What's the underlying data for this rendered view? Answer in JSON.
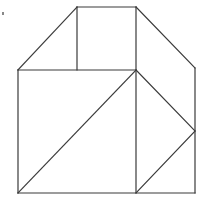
{
  "diagram": {
    "type": "geometric-dissection",
    "stroke_color": "#3a3a3a",
    "background": "#ffffff",
    "vertices": {
      "A": [
        77,
        7
      ],
      "B": [
        136,
        7
      ],
      "C": [
        195,
        68
      ],
      "D": [
        195,
        131
      ],
      "E": [
        195,
        193
      ],
      "F": [
        136,
        193
      ],
      "G": [
        18,
        193
      ],
      "H": [
        18,
        70
      ],
      "I": [
        77,
        70
      ],
      "J": [
        136,
        70
      ]
    },
    "edges": [
      {
        "name": "top-edge",
        "from": "A",
        "to": "B"
      },
      {
        "name": "roof-right",
        "from": "B",
        "to": "C"
      },
      {
        "name": "right-edge",
        "from": "C",
        "to": "E"
      },
      {
        "name": "bottom-edge",
        "from": "E",
        "to": "G"
      },
      {
        "name": "left-edge",
        "from": "G",
        "to": "H"
      },
      {
        "name": "roof-left",
        "from": "H",
        "to": "A"
      },
      {
        "name": "inner-vertical-top",
        "from": "A",
        "to": "I"
      },
      {
        "name": "middle-horizontal",
        "from": "H",
        "to": "J"
      },
      {
        "name": "inner-vertical-center",
        "from": "B",
        "to": "F"
      },
      {
        "name": "main-diagonal",
        "from": "J",
        "to": "G"
      },
      {
        "name": "right-diagonal-upper",
        "from": "J",
        "to": "D"
      },
      {
        "name": "right-diagonal-lower",
        "from": "D",
        "to": "F"
      }
    ],
    "marker": {
      "x": 2,
      "y": 12,
      "w": 2,
      "h": 3
    }
  }
}
